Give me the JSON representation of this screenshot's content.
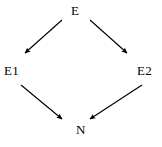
{
  "diagram": {
    "type": "directed-graph",
    "shape": "diamond",
    "background_color": "#ffffff",
    "stroke_color": "#000000",
    "canvas": {
      "width": 162,
      "height": 147
    },
    "nodes": [
      {
        "id": "E",
        "label": "E",
        "position": "top",
        "x": 78,
        "y": 11
      },
      {
        "id": "E1",
        "label": "E1",
        "position": "left",
        "x": 12,
        "y": 71
      },
      {
        "id": "E2",
        "label": "E2",
        "position": "right",
        "x": 145,
        "y": 71
      },
      {
        "id": "N",
        "label": "N",
        "position": "bottom",
        "x": 82,
        "y": 130
      }
    ],
    "edges": [
      {
        "id": "e-to-e1",
        "from": "E",
        "to": "E1",
        "direction": "down-left",
        "x1": 62,
        "y1": 20,
        "x2": 23,
        "y2": 55,
        "arrowhead": "filled-triangle"
      },
      {
        "id": "e-to-e2",
        "from": "E",
        "to": "E2",
        "direction": "down-right",
        "x1": 90,
        "y1": 20,
        "x2": 129,
        "y2": 55,
        "arrowhead": "filled-triangle"
      },
      {
        "id": "e1-to-n",
        "from": "E1",
        "to": "N",
        "direction": "down-right",
        "x1": 21,
        "y1": 85,
        "x2": 64,
        "y2": 121,
        "arrowhead": "filled-triangle"
      },
      {
        "id": "e2-to-n",
        "from": "E2",
        "to": "N",
        "direction": "down-left",
        "x1": 142,
        "y1": 85,
        "x2": 88,
        "y2": 121,
        "arrowhead": "filled-triangle"
      }
    ]
  }
}
